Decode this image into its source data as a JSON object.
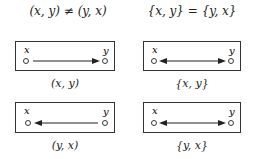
{
  "headings": {
    "left": "(x, y) ≠ (y, x)",
    "right": "{x, y} = {y, x}"
  },
  "panels": [
    {
      "id": "ordered-xy",
      "node_left": "x",
      "node_right": "y",
      "arrow": "right",
      "caption": "(x, y)"
    },
    {
      "id": "set-xy",
      "node_left": "x",
      "node_right": "y",
      "arrow": "both",
      "caption": "{x, y}"
    },
    {
      "id": "ordered-yx",
      "node_left": "x",
      "node_right": "y",
      "arrow": "left",
      "caption": "(y, x)"
    },
    {
      "id": "set-yx",
      "node_left": "x",
      "node_right": "y",
      "arrow": "both",
      "caption": "{y, x}"
    }
  ],
  "colors": {
    "stroke": "#222222",
    "background": "#ffffff"
  }
}
